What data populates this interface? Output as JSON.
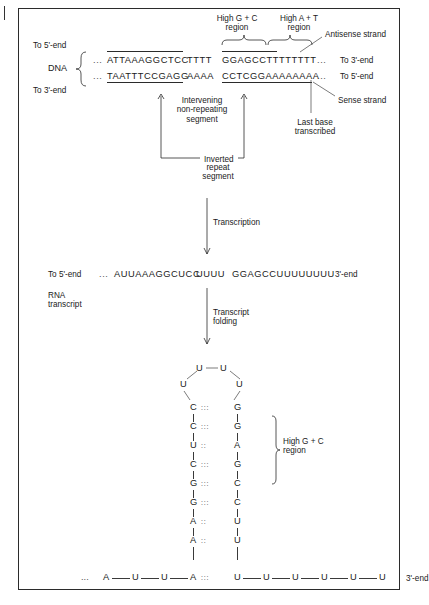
{
  "figure": {
    "title_region_labels": {
      "high_gc_top": "High G + C\nregion",
      "high_at_top": "High A + T\nregion",
      "antisense": "Antisense strand",
      "sense": "Sense strand",
      "last_base": "Last base\ntranscribed"
    },
    "dna": {
      "molecule_label": "DNA",
      "to5_left": "To 5'-end",
      "to3_left": "To 3'-end",
      "to3_right": "To 3'-end",
      "to5_right": "To 5'-end",
      "ellipsis_left": "...",
      "ellipsis_right": "...",
      "top_strand": {
        "repeat_left": "ATTAAAGGCTCC",
        "spacer": "TTTT",
        "repeat_right": "GGAGCCTTTTTTTT"
      },
      "bottom_strand": {
        "repeat_left": "TAATTTCCGAGG",
        "spacer": "AAAA",
        "repeat_right": "CCTCGGAAAAAAAA"
      }
    },
    "annotations": {
      "intervening": "Intervening\nnon-repeating\nsegment",
      "inverted": "Inverted",
      "inverted_line2": "repeat",
      "inverted_line3": "segment",
      "transcription": "Transcription",
      "transcript_folding": "Transcript\nfolding"
    },
    "rna": {
      "to5_left": "To 5'-end",
      "label": "RNA\ntranscript",
      "ellipsis": "...",
      "seq_left": "AUUAAAGGCUCC",
      "seq_spacer": "UUUU",
      "seq_right": "GGAGCCUUUUUUUU",
      "end3": "3'-end"
    },
    "hairpin": {
      "loop_top": [
        "U",
        "U"
      ],
      "loop_sides": [
        "U",
        "U"
      ],
      "stem": [
        {
          "left": "C",
          "right": "G",
          "bond": ":::"
        },
        {
          "left": "C",
          "right": "G",
          "bond": ":::"
        },
        {
          "left": "U",
          "right": "A",
          "bond": "::"
        },
        {
          "left": "C",
          "right": "G",
          "bond": ":::"
        },
        {
          "left": "G",
          "right": "C",
          "bond": ":::"
        },
        {
          "left": "G",
          "right": "C",
          "bond": ":::"
        },
        {
          "left": "A",
          "right": "U",
          "bond": "::"
        },
        {
          "left": "A",
          "right": "U",
          "bond": "::"
        }
      ],
      "base_row": {
        "ellipsis": "...",
        "left_tail": [
          "A",
          "U",
          "U"
        ],
        "pair_left": "A",
        "pair_bond": ":::",
        "pair_right": "U",
        "right_tail": [
          "U",
          "U",
          "U",
          "U",
          "U"
        ],
        "end3": "3'-end"
      },
      "gc_bracket_label": "High G + C\nregion"
    }
  }
}
